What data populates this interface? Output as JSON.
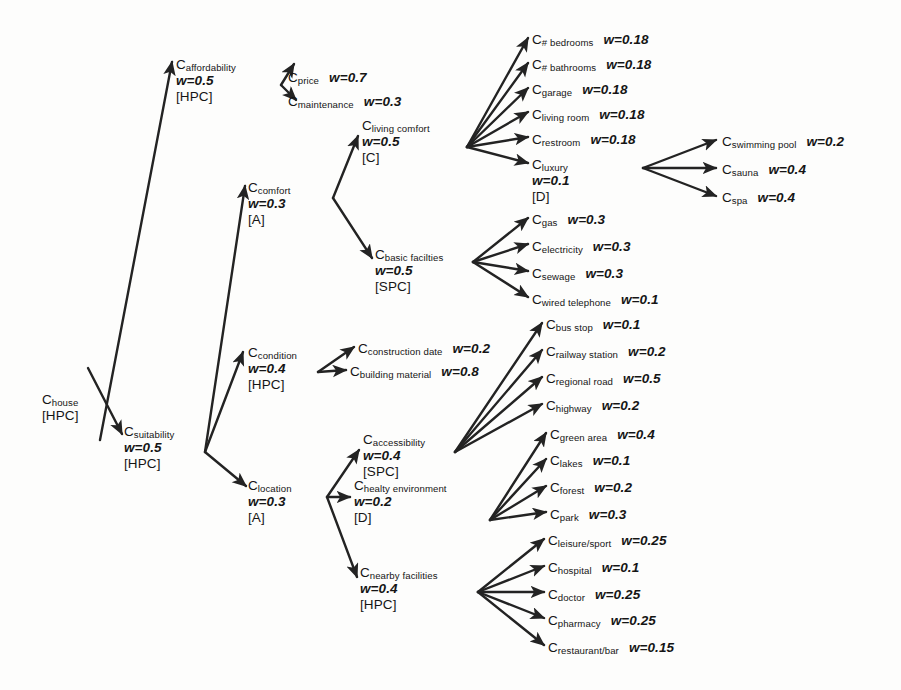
{
  "diagram": {
    "nodes": [
      {
        "id": "house",
        "label": "C",
        "sub": "house",
        "weight": "",
        "type": "[HPC]",
        "x": 42,
        "y": 392,
        "layout": "stacked"
      },
      {
        "id": "affordability",
        "label": "C",
        "sub": "affordability",
        "weight": "w=0.5",
        "type": "[HPC]",
        "x": 176,
        "y": 57,
        "layout": "stacked"
      },
      {
        "id": "suitability",
        "label": "C",
        "sub": "suitability",
        "weight": "w=0.5",
        "type": "[HPC]",
        "x": 124,
        "y": 424,
        "layout": "stacked"
      },
      {
        "id": "price",
        "label": "C",
        "sub": "price",
        "weight": "w=0.7",
        "type": "",
        "x": 288,
        "y": 70,
        "layout": "inline"
      },
      {
        "id": "maintenance",
        "label": "C",
        "sub": "maintenance",
        "weight": "w=0.3",
        "type": "",
        "x": 288,
        "y": 94,
        "layout": "inline"
      },
      {
        "id": "comfort",
        "label": "C",
        "sub": "comfort",
        "weight": "w=0.3",
        "type": "[A]",
        "x": 248,
        "y": 180,
        "layout": "stacked"
      },
      {
        "id": "condition",
        "label": "C",
        "sub": "condition",
        "weight": "w=0.4",
        "type": "[HPC]",
        "x": 248,
        "y": 345,
        "layout": "stacked"
      },
      {
        "id": "location",
        "label": "C",
        "sub": "location",
        "weight": "w=0.3",
        "type": "[A]",
        "x": 248,
        "y": 478,
        "layout": "stacked"
      },
      {
        "id": "livingcomfort",
        "label": "C",
        "sub": "living comfort",
        "weight": "w=0.5",
        "type": "[C]",
        "x": 362,
        "y": 118,
        "layout": "stacked"
      },
      {
        "id": "basicfac",
        "label": "C",
        "sub": "basic facilties",
        "weight": "w=0.5",
        "type": "[SPC]",
        "x": 375,
        "y": 247,
        "layout": "stacked"
      },
      {
        "id": "constrdate",
        "label": "C",
        "sub": "construction date",
        "weight": "w=0.2",
        "type": "",
        "x": 358,
        "y": 341,
        "layout": "inline"
      },
      {
        "id": "buildmat",
        "label": "C",
        "sub": "building material",
        "weight": "w=0.8",
        "type": "",
        "x": 350,
        "y": 364,
        "layout": "inline"
      },
      {
        "id": "accessibility",
        "label": "C",
        "sub": "accessibility",
        "weight": "w=0.4",
        "type": "[SPC]",
        "x": 363,
        "y": 432,
        "layout": "stacked"
      },
      {
        "id": "healthyenv",
        "label": "C",
        "sub": "healty environment",
        "weight": "w=0.2",
        "type": "[D]",
        "x": 354,
        "y": 478,
        "layout": "stacked"
      },
      {
        "id": "nearbyfac",
        "label": "C",
        "sub": "nearby facilities",
        "weight": "w=0.4",
        "type": "[HPC]",
        "x": 360,
        "y": 565,
        "layout": "stacked"
      },
      {
        "id": "bedrooms",
        "label": "C",
        "sub": "# bedrooms",
        "weight": "w=0.18",
        "type": "",
        "x": 532,
        "y": 32,
        "layout": "inline"
      },
      {
        "id": "bathrooms",
        "label": "C",
        "sub": "# bathrooms",
        "weight": "w=0.18",
        "type": "",
        "x": 532,
        "y": 57,
        "layout": "inline"
      },
      {
        "id": "garage",
        "label": "C",
        "sub": "garage",
        "weight": "w=0.18",
        "type": "",
        "x": 532,
        "y": 82,
        "layout": "inline"
      },
      {
        "id": "livingroom",
        "label": "C",
        "sub": "living room",
        "weight": "w=0.18",
        "type": "",
        "x": 532,
        "y": 107,
        "layout": "inline"
      },
      {
        "id": "restroom",
        "label": "C",
        "sub": "restroom",
        "weight": "w=0.18",
        "type": "",
        "x": 532,
        "y": 132,
        "layout": "inline"
      },
      {
        "id": "luxury",
        "label": "C",
        "sub": "luxury",
        "weight": "w=0.1",
        "type": "[D]",
        "x": 532,
        "y": 157,
        "layout": "stacked"
      },
      {
        "id": "swimmingpool",
        "label": "C",
        "sub": "swimming pool",
        "weight": "w=0.2",
        "type": "",
        "x": 722,
        "y": 134,
        "layout": "inline"
      },
      {
        "id": "sauna",
        "label": "C",
        "sub": "sauna",
        "weight": "w=0.4",
        "type": "",
        "x": 722,
        "y": 162,
        "layout": "inline"
      },
      {
        "id": "spa",
        "label": "C",
        "sub": "spa",
        "weight": "w=0.4",
        "type": "",
        "x": 722,
        "y": 190,
        "layout": "inline"
      },
      {
        "id": "gas",
        "label": "C",
        "sub": "gas",
        "weight": "w=0.3",
        "type": "",
        "x": 532,
        "y": 212,
        "layout": "inline"
      },
      {
        "id": "electricity",
        "label": "C",
        "sub": "electricity",
        "weight": "w=0.3",
        "type": "",
        "x": 532,
        "y": 239,
        "layout": "inline"
      },
      {
        "id": "sewage",
        "label": "C",
        "sub": "sewage",
        "weight": "w=0.3",
        "type": "",
        "x": 532,
        "y": 266,
        "layout": "inline"
      },
      {
        "id": "wiredtel",
        "label": "C",
        "sub": "wired telephone",
        "weight": "w=0.1",
        "type": "",
        "x": 532,
        "y": 292,
        "layout": "inline"
      },
      {
        "id": "busstop",
        "label": "C",
        "sub": "bus stop",
        "weight": "w=0.1",
        "type": "",
        "x": 546,
        "y": 317,
        "layout": "inline"
      },
      {
        "id": "railway",
        "label": "C",
        "sub": "railway station",
        "weight": "w=0.2",
        "type": "",
        "x": 546,
        "y": 344,
        "layout": "inline"
      },
      {
        "id": "regroad",
        "label": "C",
        "sub": "regional road",
        "weight": "w=0.5",
        "type": "",
        "x": 546,
        "y": 371,
        "layout": "inline"
      },
      {
        "id": "highway",
        "label": "C",
        "sub": "highway",
        "weight": "w=0.2",
        "type": "",
        "x": 546,
        "y": 398,
        "layout": "inline"
      },
      {
        "id": "greenarea",
        "label": "C",
        "sub": "green area",
        "weight": "w=0.4",
        "type": "",
        "x": 550,
        "y": 427,
        "layout": "inline"
      },
      {
        "id": "lakes",
        "label": "C",
        "sub": "lakes",
        "weight": "w=0.1",
        "type": "",
        "x": 550,
        "y": 453,
        "layout": "inline"
      },
      {
        "id": "forest",
        "label": "C",
        "sub": "forest",
        "weight": "w=0.2",
        "type": "",
        "x": 550,
        "y": 480,
        "layout": "inline"
      },
      {
        "id": "park",
        "label": "C",
        "sub": "park",
        "weight": "w=0.3",
        "type": "",
        "x": 550,
        "y": 507,
        "layout": "inline"
      },
      {
        "id": "leisure",
        "label": "C",
        "sub": "leisure/sport",
        "weight": "w=0.25",
        "type": "",
        "x": 548,
        "y": 533,
        "layout": "inline"
      },
      {
        "id": "hospital",
        "label": "C",
        "sub": "hospital",
        "weight": "w=0.1",
        "type": "",
        "x": 548,
        "y": 560,
        "layout": "inline"
      },
      {
        "id": "doctor",
        "label": "C",
        "sub": "doctor",
        "weight": "w=0.25",
        "type": "",
        "x": 548,
        "y": 587,
        "layout": "inline"
      },
      {
        "id": "pharmacy",
        "label": "C",
        "sub": "pharmacy",
        "weight": "w=0.25",
        "type": "",
        "x": 548,
        "y": 613,
        "layout": "inline"
      },
      {
        "id": "restaurant",
        "label": "C",
        "sub": "restaurant/bar",
        "weight": "w=0.15",
        "type": "",
        "x": 548,
        "y": 640,
        "layout": "inline"
      }
    ],
    "edges": [
      {
        "from": "house",
        "to": "affordability",
        "x1": 100,
        "y1": 440,
        "x2": 172,
        "y2": 62
      },
      {
        "from": "house",
        "to": "suitability",
        "x1": 88,
        "y1": 368,
        "x2": 122,
        "y2": 434
      },
      {
        "from": "affordability",
        "to": "price",
        "x1": 281,
        "y1": 85,
        "x2": 294,
        "y2": 64
      },
      {
        "from": "affordability",
        "to": "maintenance",
        "x1": 281,
        "y1": 85,
        "x2": 296,
        "y2": 100
      },
      {
        "from": "suitability",
        "to": "comfort",
        "x1": 205,
        "y1": 452,
        "x2": 245,
        "y2": 186
      },
      {
        "from": "suitability",
        "to": "condition",
        "x1": 205,
        "y1": 452,
        "x2": 243,
        "y2": 352
      },
      {
        "from": "suitability",
        "to": "location",
        "x1": 205,
        "y1": 452,
        "x2": 246,
        "y2": 486
      },
      {
        "from": "comfort",
        "to": "livingcomfort",
        "x1": 333,
        "y1": 198,
        "x2": 358,
        "y2": 136
      },
      {
        "from": "comfort",
        "to": "basicfac",
        "x1": 333,
        "y1": 198,
        "x2": 372,
        "y2": 258
      },
      {
        "from": "livingcomfort",
        "to": "bedrooms",
        "x1": 467,
        "y1": 147,
        "x2": 528,
        "y2": 38
      },
      {
        "from": "livingcomfort",
        "to": "bathrooms",
        "x1": 467,
        "y1": 147,
        "x2": 528,
        "y2": 63
      },
      {
        "from": "livingcomfort",
        "to": "garage",
        "x1": 467,
        "y1": 147,
        "x2": 528,
        "y2": 88
      },
      {
        "from": "livingcomfort",
        "to": "livingroom",
        "x1": 467,
        "y1": 147,
        "x2": 528,
        "y2": 112
      },
      {
        "from": "livingcomfort",
        "to": "restroom",
        "x1": 467,
        "y1": 147,
        "x2": 528,
        "y2": 137
      },
      {
        "from": "livingcomfort",
        "to": "luxury",
        "x1": 467,
        "y1": 147,
        "x2": 528,
        "y2": 163
      },
      {
        "from": "luxury",
        "to": "swimmingpool",
        "x1": 643,
        "y1": 168,
        "x2": 716,
        "y2": 140
      },
      {
        "from": "luxury",
        "to": "sauna",
        "x1": 643,
        "y1": 168,
        "x2": 716,
        "y2": 168
      },
      {
        "from": "luxury",
        "to": "spa",
        "x1": 643,
        "y1": 168,
        "x2": 716,
        "y2": 196
      },
      {
        "from": "basicfac",
        "to": "gas",
        "x1": 473,
        "y1": 262,
        "x2": 528,
        "y2": 218
      },
      {
        "from": "basicfac",
        "to": "electricity",
        "x1": 473,
        "y1": 262,
        "x2": 528,
        "y2": 244
      },
      {
        "from": "basicfac",
        "to": "sewage",
        "x1": 473,
        "y1": 262,
        "x2": 528,
        "y2": 271
      },
      {
        "from": "basicfac",
        "to": "wiredtel",
        "x1": 473,
        "y1": 262,
        "x2": 528,
        "y2": 297
      },
      {
        "from": "condition",
        "to": "constrdate",
        "x1": 318,
        "y1": 372,
        "x2": 354,
        "y2": 347
      },
      {
        "from": "condition",
        "to": "buildmat",
        "x1": 318,
        "y1": 372,
        "x2": 346,
        "y2": 370
      },
      {
        "from": "accessibility",
        "to": "busstop",
        "x1": 455,
        "y1": 452,
        "x2": 542,
        "y2": 323
      },
      {
        "from": "accessibility",
        "to": "railway",
        "x1": 455,
        "y1": 452,
        "x2": 542,
        "y2": 350
      },
      {
        "from": "accessibility",
        "to": "regroad",
        "x1": 455,
        "y1": 452,
        "x2": 542,
        "y2": 377
      },
      {
        "from": "accessibility",
        "to": "highway",
        "x1": 455,
        "y1": 452,
        "x2": 542,
        "y2": 404
      },
      {
        "from": "healthyenv",
        "to": "greenarea",
        "x1": 490,
        "y1": 520,
        "x2": 546,
        "y2": 433
      },
      {
        "from": "healthyenv",
        "to": "lakes",
        "x1": 490,
        "y1": 520,
        "x2": 546,
        "y2": 459
      },
      {
        "from": "healthyenv",
        "to": "forest",
        "x1": 490,
        "y1": 520,
        "x2": 546,
        "y2": 486
      },
      {
        "from": "healthyenv",
        "to": "park",
        "x1": 490,
        "y1": 520,
        "x2": 546,
        "y2": 512
      },
      {
        "from": "nearbyfac",
        "to": "leisure",
        "x1": 478,
        "y1": 592,
        "x2": 544,
        "y2": 539
      },
      {
        "from": "nearbyfac",
        "to": "hospital",
        "x1": 478,
        "y1": 592,
        "x2": 544,
        "y2": 566
      },
      {
        "from": "nearbyfac",
        "to": "doctor",
        "x1": 478,
        "y1": 592,
        "x2": 544,
        "y2": 592
      },
      {
        "from": "nearbyfac",
        "to": "pharmacy",
        "x1": 478,
        "y1": 592,
        "x2": 544,
        "y2": 618
      },
      {
        "from": "nearbyfac",
        "to": "restaurant",
        "x1": 478,
        "y1": 592,
        "x2": 544,
        "y2": 645
      },
      {
        "from": "location",
        "to": "accessibility",
        "x1": 327,
        "y1": 497,
        "x2": 359,
        "y2": 450
      },
      {
        "from": "location",
        "to": "healthyenv",
        "x1": 327,
        "y1": 497,
        "x2": 350,
        "y2": 497
      },
      {
        "from": "location",
        "to": "nearbyfac",
        "x1": 327,
        "y1": 497,
        "x2": 357,
        "y2": 577
      }
    ],
    "edge_color": "#232323"
  }
}
